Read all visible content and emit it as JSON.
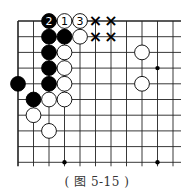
{
  "figure": {
    "caption": "( 图 5-15 )",
    "grid": {
      "cols": 11,
      "rows": 10,
      "x0": 18,
      "y0": 21,
      "dx": 15.5,
      "dy": 15.7,
      "top_edge": true,
      "left_edge": true
    },
    "star_points": [
      [
        9,
        3
      ],
      [
        3,
        9
      ],
      [
        9,
        9
      ]
    ],
    "stones": [
      {
        "col": 2,
        "row": 0,
        "color": "black",
        "label": "2"
      },
      {
        "col": 3,
        "row": 0,
        "color": "white",
        "label": "1"
      },
      {
        "col": 4,
        "row": 0,
        "color": "white",
        "label": "3"
      },
      {
        "col": 2,
        "row": 1,
        "color": "black",
        "label": ""
      },
      {
        "col": 3,
        "row": 1,
        "color": "black",
        "label": ""
      },
      {
        "col": 4,
        "row": 1,
        "color": "white",
        "label": ""
      },
      {
        "col": 2,
        "row": 2,
        "color": "black",
        "label": ""
      },
      {
        "col": 3,
        "row": 2,
        "color": "white",
        "label": ""
      },
      {
        "col": 8,
        "row": 2,
        "color": "white",
        "label": ""
      },
      {
        "col": 2,
        "row": 3,
        "color": "black",
        "label": ""
      },
      {
        "col": 3,
        "row": 3,
        "color": "white",
        "label": ""
      },
      {
        "col": 0,
        "row": 4,
        "color": "black",
        "label": ""
      },
      {
        "col": 2,
        "row": 4,
        "color": "black",
        "label": ""
      },
      {
        "col": 3,
        "row": 4,
        "color": "white",
        "label": ""
      },
      {
        "col": 8,
        "row": 4,
        "color": "white",
        "label": ""
      },
      {
        "col": 1,
        "row": 5,
        "color": "black",
        "label": ""
      },
      {
        "col": 2,
        "row": 5,
        "color": "white",
        "label": ""
      },
      {
        "col": 3,
        "row": 5,
        "color": "white",
        "label": ""
      },
      {
        "col": 1,
        "row": 6,
        "color": "white",
        "label": ""
      },
      {
        "col": 2,
        "row": 7,
        "color": "white",
        "label": ""
      }
    ],
    "marks": [
      {
        "col": 5,
        "row": 0,
        "symbol": "×"
      },
      {
        "col": 6,
        "row": 0,
        "symbol": "×"
      },
      {
        "col": 5,
        "row": 1,
        "symbol": "×"
      },
      {
        "col": 6,
        "row": 1,
        "symbol": "×"
      }
    ]
  }
}
